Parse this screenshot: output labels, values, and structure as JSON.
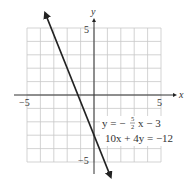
{
  "chart_data": {
    "type": "line",
    "title": "",
    "xlabel": "x",
    "ylabel": "y",
    "xlim": [
      -5,
      5
    ],
    "ylim": [
      -5,
      5
    ],
    "grid": true,
    "x_ticks": [
      "-5",
      "5"
    ],
    "y_ticks": [
      "5",
      "-5"
    ],
    "series": [
      {
        "name": "y = -5/2 x - 3",
        "equation_slope_intercept": "y = −(5/2)x − 3",
        "equation_standard": "10x + 4y = −12",
        "slope": -2.5,
        "intercept": -3,
        "x": [
          -3.6,
          1.2
        ],
        "y": [
          6,
          -6
        ],
        "arrows": "both"
      }
    ],
    "annotations": [
      {
        "text": "y = −",
        "frac_num": "5",
        "frac_den": "2",
        "suffix": "x − 3"
      },
      {
        "text": "10x + 4y = −12"
      }
    ]
  },
  "labels": {
    "x_axis": "x",
    "y_axis": "y",
    "x_min": "−5",
    "x_max": "5",
    "y_max": "5",
    "y_min": "−5",
    "eq1_prefix": "y = −",
    "eq1_num": "5",
    "eq1_den": "2",
    "eq1_suffix": "x − 3",
    "eq2": "10x + 4y = −12"
  }
}
